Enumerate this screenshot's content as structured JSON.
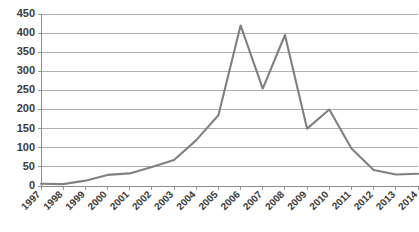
{
  "chart_data": {
    "type": "line",
    "title": "",
    "subtitle": "",
    "xlabel": "",
    "ylabel": "",
    "categories": [
      "1997",
      "1998",
      "1999",
      "2000",
      "2001",
      "2002",
      "2003",
      "2004",
      "2005",
      "2006",
      "2007",
      "2008",
      "2009",
      "2010",
      "2011",
      "2012",
      "2013",
      "2014"
    ],
    "x": [
      1997,
      1998,
      1999,
      2000,
      2001,
      2002,
      2003,
      2004,
      2005,
      2006,
      2007,
      2008,
      2009,
      2010,
      2011,
      2012,
      2013,
      2014
    ],
    "values": [
      6,
      5,
      14,
      29,
      33,
      50,
      68,
      120,
      185,
      420,
      255,
      395,
      150,
      200,
      98,
      42,
      30,
      32
    ],
    "series": [
      {
        "name": "series-1",
        "color": "#808080",
        "values": [
          6,
          5,
          14,
          29,
          33,
          50,
          68,
          120,
          185,
          420,
          255,
          395,
          150,
          200,
          98,
          42,
          30,
          32
        ]
      }
    ],
    "ylim": [
      0,
      450
    ],
    "ytick_values": [
      0,
      50,
      100,
      150,
      200,
      250,
      300,
      350,
      400,
      450
    ],
    "ytick_labels": [
      "0",
      "50",
      "100",
      "150",
      "200",
      "250",
      "300",
      "350",
      "400",
      "450"
    ],
    "xtick_labels": [
      "1997",
      "1998",
      "1999",
      "2000",
      "2001",
      "2002",
      "2003",
      "2004",
      "2005",
      "2006",
      "2007",
      "2008",
      "2009",
      "2010",
      "2011",
      "2012",
      "2013",
      "2014"
    ],
    "grid": {
      "horizontal": true,
      "vertical": false,
      "color": "#9a9a9a"
    },
    "legend": {
      "visible": false,
      "position": "none",
      "entries": []
    },
    "markers": false,
    "xtick_label_rotation": -45,
    "plot_background": "#ffffff",
    "axis_color": "#8c8c8c",
    "label_color": "#3a3a3a"
  }
}
